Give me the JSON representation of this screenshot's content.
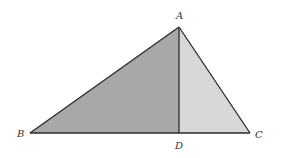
{
  "diagram": {
    "type": "geometry-triangle",
    "points": {
      "A": {
        "label": "A",
        "x": 179,
        "y": 27
      },
      "B": {
        "label": "B",
        "x": 30,
        "y": 133
      },
      "C": {
        "label": "C",
        "x": 250,
        "y": 133
      },
      "D": {
        "label": "D",
        "x": 179,
        "y": 133
      }
    },
    "regions": [
      {
        "name": "triangle-ABD",
        "vertices": [
          "A",
          "B",
          "D"
        ],
        "fill": "#a8a8a8"
      },
      {
        "name": "triangle-ADC",
        "vertices": [
          "A",
          "D",
          "C"
        ],
        "fill": "#d8d8d8"
      }
    ],
    "segments": [
      {
        "from": "A",
        "to": "B"
      },
      {
        "from": "B",
        "to": "C"
      },
      {
        "from": "C",
        "to": "A"
      },
      {
        "from": "A",
        "to": "D"
      }
    ],
    "colors": {
      "stroke": "#2a2a2a",
      "dark_fill": "#a8a8a8",
      "light_fill": "#d8d8d8",
      "background": "#ffffff"
    },
    "labels": {
      "A": "A",
      "B": "B",
      "C": "C",
      "D": "D"
    }
  }
}
